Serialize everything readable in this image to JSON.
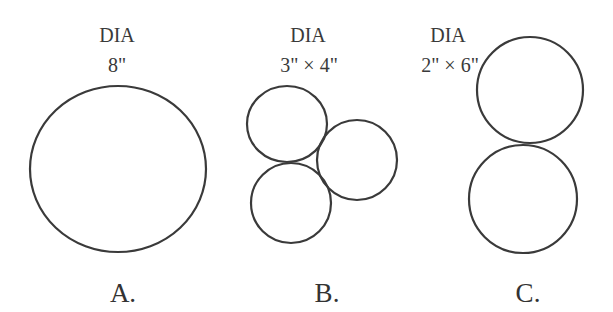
{
  "figures": [
    {
      "id": "A",
      "label": "A.",
      "header": "DIA",
      "dimension": "8\"",
      "circles": [
        {
          "cx": 118,
          "cy": 169,
          "rx": 88,
          "ry": 83
        }
      ]
    },
    {
      "id": "B",
      "label": "B.",
      "header": "DIA",
      "dimension": "3\" × 4\"",
      "circles": [
        {
          "cx": 287,
          "cy": 124,
          "rx": 40,
          "ry": 38
        },
        {
          "cx": 357,
          "cy": 160,
          "rx": 40,
          "ry": 40
        },
        {
          "cx": 291,
          "cy": 203,
          "rx": 40,
          "ry": 40
        }
      ]
    },
    {
      "id": "C",
      "label": "C.",
      "header": "DIA",
      "dimension": "2\" × 6\"",
      "circles": [
        {
          "cx": 530,
          "cy": 90,
          "rx": 53,
          "ry": 53
        },
        {
          "cx": 523,
          "cy": 199,
          "rx": 54,
          "ry": 54
        }
      ]
    }
  ],
  "style": {
    "stroke": "#3a3a3a",
    "stroke_width": 2.2
  }
}
